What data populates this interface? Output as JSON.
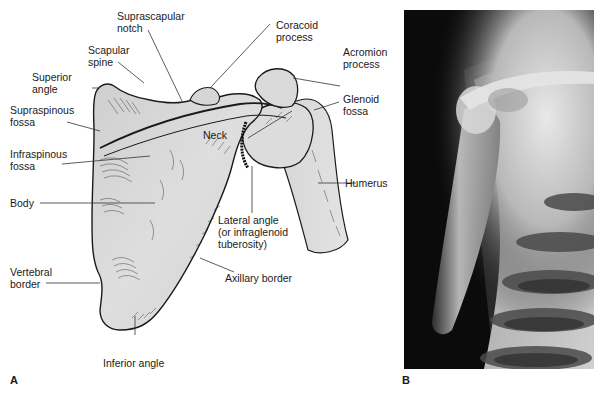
{
  "figure": {
    "panels": [
      {
        "letter": "A",
        "type": "illustration",
        "subject": "scapula-posterior-view"
      },
      {
        "letter": "B",
        "type": "radiograph",
        "subject": "shoulder-x-ray"
      }
    ],
    "labels": {
      "suprascapular_notch": "Suprascapular\nnotch",
      "coracoid_process": "Coracoid\nprocess",
      "scapular_spine": "Scapular\nspine",
      "acromion_process": "Acromion\nprocess",
      "superior_angle": "Superior\nangle",
      "glenoid_fossa": "Glenoid\nfossa",
      "supraspinous_fossa": "Supraspinous\nfossa",
      "neck": "Neck",
      "infraspinous_fossa": "Infraspinous\nfossa",
      "humerus": "Humerus",
      "body": "Body",
      "lateral_angle": "Lateral angle\n(or infraglenoid\ntuberosity)",
      "axillary_border": "Axillary border",
      "vertebral_border": "Vertebral\nborder",
      "inferior_angle": "Inferior angle"
    },
    "panel_letters": {
      "a": "A",
      "b": "B"
    },
    "colors": {
      "bone_fill": "#d9d9d9",
      "outline": "#1a1a1a",
      "leader": "#333333",
      "xray_bg": "#0b0b0b"
    }
  }
}
